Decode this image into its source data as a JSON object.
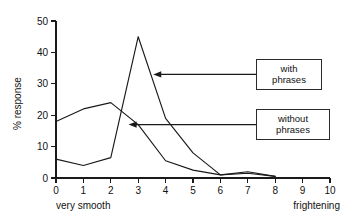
{
  "chart_data": {
    "type": "line",
    "title": "",
    "xlabel": "",
    "ylabel": "% response",
    "xlim": [
      0,
      10
    ],
    "ylim": [
      0,
      50
    ],
    "x": [
      0,
      1,
      2,
      3,
      4,
      5,
      6,
      7,
      8
    ],
    "xticks": [
      "0",
      "1",
      "2",
      "3",
      "4",
      "5",
      "6",
      "7",
      "8",
      "9",
      "10"
    ],
    "yticks": [
      "0",
      "10",
      "20",
      "30",
      "40",
      "50"
    ],
    "grid": false,
    "legend_position": "inline-callouts",
    "x_axis_left_label": "very smooth",
    "x_axis_right_label": "frightening",
    "series": [
      {
        "name": "with phrases",
        "values": [
          6,
          4,
          6.5,
          45,
          19,
          8,
          1,
          1.5,
          0.5
        ]
      },
      {
        "name": "without phrases",
        "values": [
          18,
          22,
          24,
          17,
          5.5,
          2.5,
          1,
          2,
          0.5
        ]
      }
    ],
    "annotations": [
      {
        "id": "with",
        "line1": "with",
        "line2": "phrases",
        "target_x": 3.55,
        "target_y": 33
      },
      {
        "id": "without",
        "line1": "without",
        "line2": "phrases",
        "target_x": 2.65,
        "target_y": 17
      }
    ]
  },
  "axis": {
    "y_title": "% response",
    "x_left_caption": "very smooth",
    "x_right_caption": "frightening"
  },
  "callouts": {
    "with_phrases": {
      "line1": "with",
      "line2": "phrases"
    },
    "without_phrases": {
      "line1": "without",
      "line2": "phrases"
    }
  },
  "colors": {
    "ink": "#1a1a1a",
    "background": "#ffffff"
  }
}
